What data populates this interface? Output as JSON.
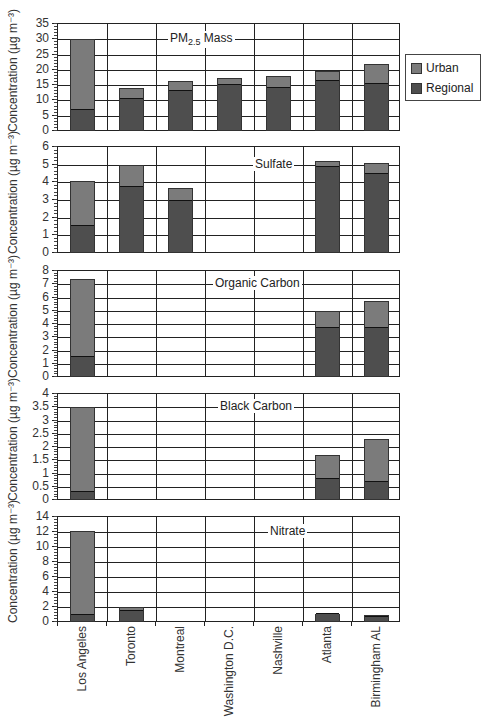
{
  "chart_data": {
    "type": "bar",
    "stacked": true,
    "categories": [
      "Los Angeles",
      "Toronto",
      "Montreal",
      "Washington D.C.",
      "Nashville",
      "Atlanta",
      "Birmingham AL"
    ],
    "ylabel": "Concentration (µg m⁻³)",
    "legend": {
      "position": "right",
      "entries": [
        "Urban",
        "Regional"
      ]
    },
    "colors": {
      "urban": "#7b7b7b",
      "regional": "#4e4e4e"
    },
    "grid": true,
    "panels": [
      {
        "title": "PM2.5 Mass",
        "ylim": [
          0,
          35
        ],
        "yticks": [
          0,
          5,
          10,
          15,
          20,
          25,
          30,
          35
        ],
        "series": [
          {
            "name": "Regional",
            "values": [
              6.5,
              10,
              12.7,
              14.8,
              13.9,
              16.1,
              15.2
            ]
          },
          {
            "name": "Urban",
            "values": [
              23.5,
              4,
              3.6,
              2.5,
              4.2,
              3.5,
              6.7
            ]
          }
        ],
        "totals": [
          30,
          14,
          16.3,
          17.3,
          18.1,
          19.6,
          21.9
        ]
      },
      {
        "title": "Sulfate",
        "ylim": [
          0,
          6
        ],
        "yticks": [
          0,
          1,
          2,
          3,
          4,
          5,
          6
        ],
        "series": [
          {
            "name": "Regional",
            "values": [
              1.45,
              3.7,
              2.9,
              null,
              null,
              4.8,
              4.4
            ]
          },
          {
            "name": "Urban",
            "values": [
              2.65,
              1.3,
              0.8,
              null,
              null,
              0.4,
              0.7
            ]
          }
        ],
        "totals": [
          4.1,
          5.0,
          3.7,
          null,
          null,
          5.2,
          5.1
        ]
      },
      {
        "title": "Organic Carbon",
        "ylim": [
          0,
          8
        ],
        "yticks": [
          0,
          1,
          2,
          3,
          4,
          5,
          6,
          7,
          8
        ],
        "series": [
          {
            "name": "Regional",
            "values": [
              1.4,
              null,
              null,
              null,
              null,
              3.6,
              3.6
            ]
          },
          {
            "name": "Urban",
            "values": [
              6.0,
              null,
              null,
              null,
              null,
              1.4,
              2.1
            ]
          }
        ],
        "totals": [
          7.4,
          null,
          null,
          null,
          null,
          5.0,
          5.7
        ]
      },
      {
        "title": "Black Carbon",
        "ylim": [
          0,
          4
        ],
        "yticks": [
          0,
          0.5,
          1,
          1.5,
          2,
          2.5,
          3,
          3.5,
          4
        ],
        "series": [
          {
            "name": "Regional",
            "values": [
              0.25,
              null,
              null,
              null,
              null,
              0.75,
              0.65
            ]
          },
          {
            "name": "Urban",
            "values": [
              3.25,
              null,
              null,
              null,
              null,
              0.95,
              1.65
            ]
          }
        ],
        "totals": [
          3.5,
          null,
          null,
          null,
          null,
          1.7,
          2.3
        ]
      },
      {
        "title": "Nitrate",
        "ylim": [
          0,
          14
        ],
        "yticks": [
          0,
          2,
          4,
          6,
          8,
          10,
          12,
          14
        ],
        "series": [
          {
            "name": "Regional",
            "values": [
              0.8,
              1.3,
              null,
              null,
              null,
              0.9,
              0.5
            ]
          },
          {
            "name": "Urban",
            "values": [
              11.4,
              0.7,
              null,
              null,
              null,
              0.2,
              0.5
            ]
          }
        ],
        "totals": [
          12.2,
          2.0,
          null,
          null,
          null,
          1.1,
          1.0
        ]
      }
    ]
  },
  "legend": {
    "urban": "Urban",
    "regional": "Regional"
  },
  "panel_titles": {
    "pm_main": "PM",
    "pm_sub": "2.5",
    "pm_rest": " Mass",
    "sulfate": "Sulfate",
    "oc": "Organic Carbon",
    "bc": "Black Carbon",
    "nitrate": "Nitrate"
  },
  "ylabel": "Concentration (µg m⁻³)"
}
